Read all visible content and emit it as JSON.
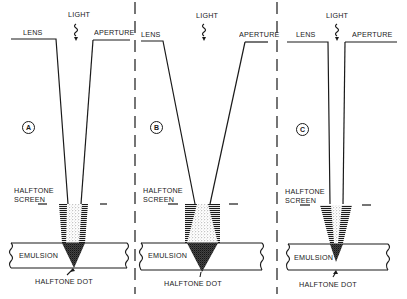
{
  "diagram": {
    "type": "optical halftone exposure comparison",
    "panels": [
      {
        "id": "A",
        "badge": "A",
        "labels": {
          "light": "LIGHT",
          "lens": "LENS",
          "aperture": "APERTURE",
          "screen_line1": "HALFTONE",
          "screen_line2": "SCREEN",
          "emulsion": "EMULSION",
          "dot": "HALFTONE DOT"
        },
        "description": "Medium aperture: light cone converges moderately through halftone screen to form dot in emulsion"
      },
      {
        "id": "B",
        "badge": "B",
        "labels": {
          "light": "LIGHT",
          "lens": "LENS",
          "aperture": "APERTURE",
          "screen_line1": "HALFTONE",
          "screen_line2": "SCREEN",
          "emulsion": "EMULSION",
          "dot": "HALFTONE DOT"
        },
        "description": "Large aperture: wide light cone produces larger halftone dot"
      },
      {
        "id": "C",
        "badge": "C",
        "labels": {
          "light": "LIGHT",
          "lens": "LENS",
          "aperture": "APERTURE",
          "screen_line1": "HALFTONE",
          "screen_line2": "SCREEN",
          "emulsion": "EMULSION",
          "dot": "HALFTONE DOT"
        },
        "description": "Small aperture: narrow light cone produces smaller halftone dot"
      }
    ],
    "colors": {
      "ink": "#1a1a1a",
      "background": "#ffffff"
    }
  }
}
